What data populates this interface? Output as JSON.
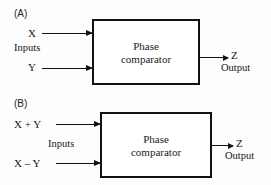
{
  "figure": {
    "background_color": "#fdfdfd",
    "line_color": "#111111",
    "text_color": "#161616"
  },
  "panels": [
    {
      "id": "a",
      "label": "(A)",
      "box": {
        "line1": "Phase",
        "line2": "comparator"
      },
      "inputs": {
        "group_label": "Inputs",
        "signals": [
          {
            "label": "X"
          },
          {
            "label": "Y"
          }
        ]
      },
      "output": {
        "label": "Z",
        "caption": "Output"
      }
    },
    {
      "id": "b",
      "label": "(B)",
      "box": {
        "line1": "Phase",
        "line2": "comparator"
      },
      "inputs": {
        "group_label": "Inputs",
        "signals": [
          {
            "label": "X + Y"
          },
          {
            "label": "X – Y"
          }
        ]
      },
      "output": {
        "label": "Z",
        "caption": "Output"
      }
    }
  ]
}
